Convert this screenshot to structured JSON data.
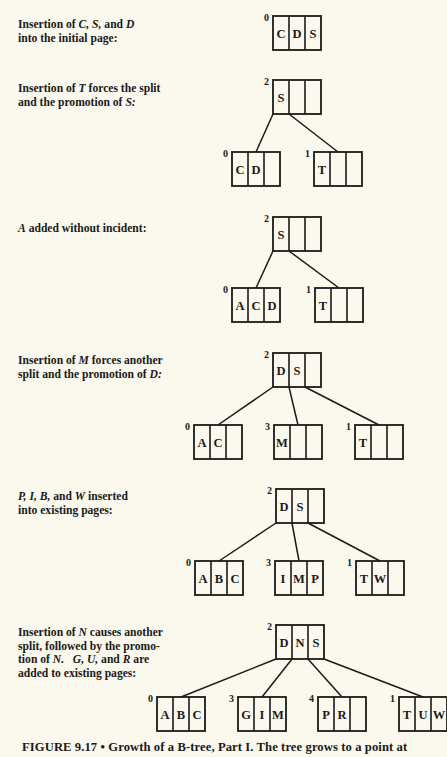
{
  "stages": [
    {
      "description_html": "Insertion of <i>C, S,</i> and <i>D</i><br>into the initial page:",
      "desc_top": 18,
      "root": {
        "page": "0",
        "keys": [
          "C",
          "D",
          "S"
        ],
        "x": 273,
        "y": 16
      },
      "children": []
    },
    {
      "description_html": "Insertion of <i>T</i> forces the split<br>and the promotion of <i>S:</i>",
      "desc_top": 82,
      "root": {
        "page": "2",
        "keys": [
          "S",
          "",
          ""
        ],
        "x": 273,
        "y": 80
      },
      "children": [
        {
          "page": "0",
          "keys": [
            "C",
            "D",
            ""
          ],
          "x": 232,
          "y": 152
        },
        {
          "page": "1",
          "keys": [
            "T",
            "",
            ""
          ],
          "x": 314,
          "y": 152
        }
      ]
    },
    {
      "description_html": "<i>A</i> added without incident:",
      "desc_top": 222,
      "root": {
        "page": "2",
        "keys": [
          "S",
          "",
          ""
        ],
        "x": 273,
        "y": 217
      },
      "children": [
        {
          "page": "0",
          "keys": [
            "A",
            "C",
            "D"
          ],
          "x": 232,
          "y": 288
        },
        {
          "page": "1",
          "keys": [
            "T",
            "",
            ""
          ],
          "x": 315,
          "y": 288
        }
      ]
    },
    {
      "description_html": "Insertion of <i>M</i> forces another<br>split and the promotion of <i>D:</i>",
      "desc_top": 354,
      "root": {
        "page": "2",
        "keys": [
          "D",
          "S",
          ""
        ],
        "x": 273,
        "y": 353
      },
      "children": [
        {
          "page": "0",
          "keys": [
            "A",
            "C",
            ""
          ],
          "x": 194,
          "y": 425
        },
        {
          "page": "3",
          "keys": [
            "M",
            "",
            ""
          ],
          "x": 274,
          "y": 425
        },
        {
          "page": "1",
          "keys": [
            "T",
            "",
            ""
          ],
          "x": 355,
          "y": 425
        }
      ]
    },
    {
      "description_html": "<i>P, I, B,</i> and <i>W</i> inserted<br>into existing pages:",
      "desc_top": 490,
      "root": {
        "page": "2",
        "keys": [
          "D",
          "S",
          ""
        ],
        "x": 276,
        "y": 489
      },
      "children": [
        {
          "page": "0",
          "keys": [
            "A",
            "B",
            "C"
          ],
          "x": 195,
          "y": 561
        },
        {
          "page": "3",
          "keys": [
            "I",
            "M",
            "P"
          ],
          "x": 275,
          "y": 561
        },
        {
          "page": "1",
          "keys": [
            "T",
            "W",
            ""
          ],
          "x": 356,
          "y": 561
        }
      ]
    },
    {
      "description_html": "Insertion of <i>N</i> causes another<br>split, followed by the promo-<br>tion of <i>N.</i> &nbsp; <i>G, U,</i> and <i>R</i> are<br>added to existing pages:",
      "desc_top": 626,
      "root": {
        "page": "2",
        "keys": [
          "D",
          "N",
          "S"
        ],
        "x": 276,
        "y": 625
      },
      "children": [
        {
          "page": "0",
          "keys": [
            "A",
            "B",
            "C"
          ],
          "x": 157,
          "y": 697
        },
        {
          "page": "3",
          "keys": [
            "G",
            "I",
            "M"
          ],
          "x": 238,
          "y": 697
        },
        {
          "page": "4",
          "keys": [
            "P",
            "R",
            ""
          ],
          "x": 318,
          "y": 697
        },
        {
          "page": "1",
          "keys": [
            "T",
            "U",
            "W"
          ],
          "x": 399,
          "y": 697
        }
      ]
    }
  ],
  "caption": "FIGURE 9.17 • Growth of a B-tree, Part I. The tree grows to a point at",
  "style": {
    "box_w": 48,
    "box_h": 34,
    "stroke": "#1a1a1a",
    "bg": "#fbf8ee"
  }
}
